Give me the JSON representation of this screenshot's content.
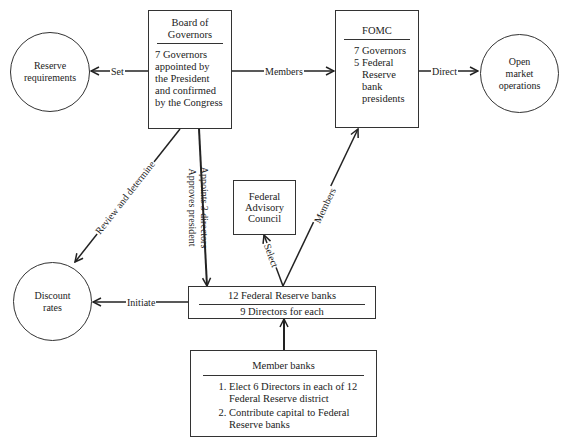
{
  "nodes": {
    "board": {
      "title_line1": "Board of",
      "title_line2": "Governors",
      "body": [
        "7 Governors",
        "appointed by",
        "the President",
        "and confirmed",
        "by the Congress"
      ]
    },
    "fomc": {
      "title": "FOMC",
      "body": [
        "7 Governors",
        "5 Federal",
        "Reserve",
        "bank",
        "presidents"
      ]
    },
    "reserve_requirements": {
      "line1": "Reserve",
      "line2": "requirements"
    },
    "open_market": {
      "line1": "Open",
      "line2": "market",
      "line3": "operations"
    },
    "advisory_council": {
      "line1": "Federal",
      "line2": "Advisory",
      "line3": "Council"
    },
    "reserve_banks": {
      "title": "12 Federal Reserve banks",
      "subtitle": "9 Directors for each"
    },
    "discount_rates": {
      "line1": "Discount",
      "line2": "rates"
    },
    "member_banks": {
      "title": "Member banks",
      "items": [
        "Elect 6 Directors in each of 12 Federal Reserve district",
        "Contribute capital to Federal Reserve banks"
      ]
    }
  },
  "edges": {
    "set": "Set",
    "members_top": "Members",
    "direct": "Direct",
    "review": "Review and determine",
    "appoints": "Appoints 3 directors",
    "approves": "Approves president",
    "select": "Select",
    "members_diag": "Members",
    "initiate": "Initiate"
  }
}
